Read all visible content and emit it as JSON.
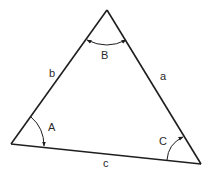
{
  "diagram": {
    "type": "triangle",
    "colors": {
      "stroke": "#1e1e1e",
      "label": "#2a2a2a",
      "background": "#ffffff"
    },
    "vertices": {
      "A": {
        "x": 11,
        "y": 144
      },
      "B": {
        "x": 107,
        "y": 10
      },
      "C": {
        "x": 201,
        "y": 164
      }
    },
    "sides": [
      {
        "name": "a",
        "label": "a",
        "from": "B",
        "to": "C",
        "label_pos": {
          "x": 160,
          "y": 80
        }
      },
      {
        "name": "b",
        "label": "b",
        "from": "A",
        "to": "B",
        "label_pos": {
          "x": 49,
          "y": 77
        }
      },
      {
        "name": "c",
        "label": "c",
        "from": "A",
        "to": "C",
        "label_pos": {
          "x": 103,
          "y": 167
        }
      }
    ],
    "angles": [
      {
        "name": "A",
        "label": "A",
        "label_pos": {
          "x": 50,
          "y": 131
        }
      },
      {
        "name": "B",
        "label": "B",
        "label_pos": {
          "x": 105,
          "y": 59
        }
      },
      {
        "name": "C",
        "label": "C",
        "label_pos": {
          "x": 161,
          "y": 145
        }
      }
    ]
  }
}
